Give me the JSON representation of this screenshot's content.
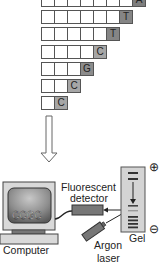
{
  "fragments": {
    "rows": [
      {
        "cells": 8,
        "base": "A",
        "shade": "#7e7e7e"
      },
      {
        "cells": 7,
        "base": "T",
        "shade": "#858585"
      },
      {
        "cells": 6,
        "base": "T",
        "shade": "#858585"
      },
      {
        "cells": 5,
        "base": "C",
        "shade": "#a6a6a6"
      },
      {
        "cells": 4,
        "base": "G",
        "shade": "#8c8c8c"
      },
      {
        "cells": 3,
        "base": "C",
        "shade": "#a6a6a6"
      },
      {
        "cells": 2,
        "base": "C",
        "shade": "#a6a6a6"
      }
    ]
  },
  "labels": {
    "screen_text": "CCGC",
    "computer": "Computer",
    "detector_line1": "Fluorescent",
    "detector_line2": "detector",
    "laser_line1": "Argon",
    "laser_line2": "laser",
    "gel": "Gel",
    "plus": "⊕",
    "minus": "⊖"
  }
}
